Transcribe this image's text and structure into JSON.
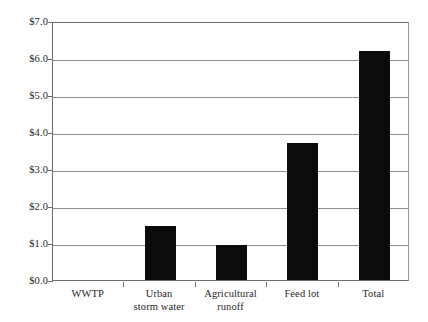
{
  "chart_data": {
    "type": "bar",
    "title": "",
    "subtitle": "",
    "xlabel": "",
    "ylabel": "",
    "categories": [
      "WWTP",
      "Urban\nstorm water",
      "Agricultural\nrunoff",
      "Feed lot",
      "Total"
    ],
    "values": [
      0.0,
      1.45,
      0.95,
      3.7,
      6.2
    ],
    "ylim": [
      0.0,
      7.0
    ],
    "ytick_values": [
      0.0,
      1.0,
      2.0,
      3.0,
      4.0,
      5.0,
      6.0,
      7.0
    ],
    "ytick_labels": [
      "$0.0",
      "$1.0",
      "$2.0",
      "$3.0",
      "$4.0",
      "$5.0",
      "$6.0",
      "$7.0"
    ],
    "grid": true,
    "grid_axis": "y",
    "legend": false,
    "legend_position": "none",
    "bar_color": "#0b0b0b",
    "gridline_color": "#8d8d8d",
    "axis_color": "#6e6e6e",
    "background_color": "#ffffff"
  }
}
